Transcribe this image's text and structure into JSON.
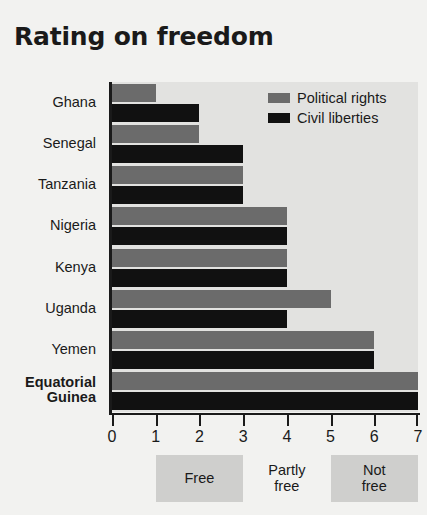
{
  "chart_data": {
    "type": "bar",
    "orientation": "horizontal",
    "title": "Rating on freedom",
    "xlabel": "",
    "ylabel": "",
    "xlim": [
      0,
      7
    ],
    "xticks": [
      "0",
      "1",
      "2",
      "3",
      "4",
      "5",
      "6",
      "7"
    ],
    "grid": false,
    "legend_position": "top-right",
    "categories": [
      "Ghana",
      "Senegal",
      "Tanzania",
      "Nigeria",
      "Kenya",
      "Uganda",
      "Yemen",
      "Equatorial Guinea"
    ],
    "category_lines": [
      [
        "Ghana"
      ],
      [
        "Senegal"
      ],
      [
        "Tanzania"
      ],
      [
        "Nigeria"
      ],
      [
        "Kenya"
      ],
      [
        "Uganda"
      ],
      [
        "Yemen"
      ],
      [
        "Equatorial",
        "Guinea"
      ]
    ],
    "highlighted_category": "Equatorial Guinea",
    "series": [
      {
        "name": "Political rights",
        "color": "#6b6b6b",
        "values": [
          1,
          2,
          3,
          4,
          4,
          5,
          6,
          7
        ]
      },
      {
        "name": "Civil liberties",
        "color": "#111111",
        "values": [
          2,
          3,
          3,
          4,
          4,
          4,
          6,
          7
        ]
      }
    ],
    "bands": [
      {
        "label": "Free",
        "lines": [
          "Free"
        ],
        "from": 1,
        "to": 3,
        "shaded": true
      },
      {
        "label": "Partly free",
        "lines": [
          "Partly",
          "free"
        ],
        "from": 3,
        "to": 5,
        "shaded": false
      },
      {
        "label": "Not free",
        "lines": [
          "Not",
          "free"
        ],
        "from": 5,
        "to": 7,
        "shaded": true
      }
    ],
    "colors": {
      "political_rights": "#6b6b6b",
      "civil_liberties": "#111111",
      "plot_background": "#e2e2e0",
      "page_background": "#f2f2f0",
      "band_shade": "#cfcfcd",
      "axis": "#1a1a1a"
    }
  }
}
